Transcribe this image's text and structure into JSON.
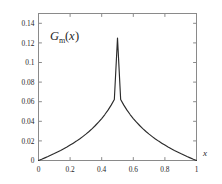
{
  "chart_data": {
    "type": "line",
    "title": "",
    "subtitle": "",
    "xlabel": "x",
    "ylabel": "",
    "annotation_label": {
      "full": "G_m(x)",
      "base": "G",
      "subscript": "m",
      "open_paren": "(",
      "variable": "x",
      "close_paren": ")"
    },
    "xlim": [
      0,
      1
    ],
    "ylim": [
      0,
      0.15
    ],
    "grid": false,
    "legend": null,
    "legend_position": "none",
    "frame": "box",
    "tick_direction": "in",
    "ticks_all_sides": true,
    "xticks": [
      0,
      0.2,
      0.4,
      0.6,
      0.8,
      1
    ],
    "xtick_labels": [
      "0",
      "0.2",
      "0.4",
      "0.6",
      "0.8",
      "1"
    ],
    "yticks": [
      0,
      0.02,
      0.04,
      0.06,
      0.08,
      0.1,
      0.12,
      0.14
    ],
    "ytick_labels": [
      "0",
      "0.02",
      "0.04",
      "0.06",
      "0.08",
      "0.1",
      "0.12",
      "0.14"
    ],
    "series": [
      {
        "name": "G_m(x)",
        "color": "#2b2b2b",
        "peak_x": 0.5,
        "peak_y": 0.125,
        "x": [
          0,
          0.02,
          0.04,
          0.06,
          0.08,
          0.1,
          0.12,
          0.14,
          0.16,
          0.18,
          0.2,
          0.22,
          0.24,
          0.26,
          0.28,
          0.3,
          0.32,
          0.34,
          0.36,
          0.38,
          0.4,
          0.42,
          0.44,
          0.46,
          0.48,
          0.5,
          0.52,
          0.54,
          0.56,
          0.58,
          0.6,
          0.62,
          0.64,
          0.66,
          0.68,
          0.7,
          0.72,
          0.74,
          0.76,
          0.78,
          0.8,
          0.82,
          0.84,
          0.86,
          0.88,
          0.9,
          0.92,
          0.94,
          0.96,
          0.98,
          1
        ],
        "values": [
          0.0,
          0.0013,
          0.0027,
          0.0041,
          0.0056,
          0.0071,
          0.0087,
          0.0103,
          0.012,
          0.0138,
          0.0157,
          0.0177,
          0.0198,
          0.022,
          0.0244,
          0.0269,
          0.0296,
          0.0325,
          0.0357,
          0.0391,
          0.0428,
          0.0469,
          0.0514,
          0.0565,
          0.0623,
          0.125,
          0.0623,
          0.0565,
          0.0514,
          0.0469,
          0.0428,
          0.0391,
          0.0357,
          0.0325,
          0.0296,
          0.0269,
          0.0244,
          0.022,
          0.0198,
          0.0177,
          0.0157,
          0.0138,
          0.012,
          0.0103,
          0.0087,
          0.0071,
          0.0056,
          0.0041,
          0.0027,
          0.0013,
          0.0
        ]
      }
    ],
    "colors": {
      "curve": "#2b2b2b",
      "frame": "#8a8a8a",
      "text": "#1f1f1f",
      "background": "#ffffff"
    }
  }
}
